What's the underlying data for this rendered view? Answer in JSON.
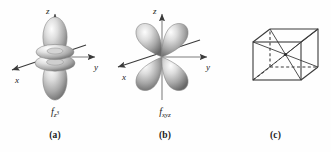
{
  "figure": {
    "background_color": "#ffffff",
    "line_color": "#3a3a3a",
    "text_color": "#1a1a1a",
    "lobe_light": "#f2f2f2",
    "lobe_mid": "#b9b9b9",
    "lobe_dark": "#6e6e6e"
  },
  "panels": [
    {
      "id": "a",
      "caption": "(a)",
      "orbital_symbol": "f",
      "orbital_sub": "z",
      "orbital_sup": "3",
      "orbital_name": "f_z3",
      "axes": [
        {
          "name": "z",
          "label": "z",
          "direction": "up"
        },
        {
          "name": "y",
          "label": "y",
          "direction": "right"
        },
        {
          "name": "x",
          "label": "x",
          "direction": "down-left"
        }
      ],
      "shape_description": "two axial lobes along z with two toroidal rings"
    },
    {
      "id": "b",
      "caption": "(b)",
      "orbital_symbol": "f",
      "orbital_sub": "xyz",
      "orbital_sup": "",
      "orbital_name": "f_xyz",
      "axes": [
        {
          "name": "z",
          "label": "z",
          "direction": "up"
        },
        {
          "name": "y",
          "label": "y",
          "direction": "right"
        },
        {
          "name": "x",
          "label": "x",
          "direction": "down-left"
        }
      ],
      "shape_description": "eight lobes pointing to cube corners, four visible"
    },
    {
      "id": "c",
      "caption": "(c)",
      "orbital_symbol": "",
      "orbital_sub": "",
      "orbital_sup": "",
      "orbital_name": "cube-diagram",
      "axes": [],
      "shape_description": "cube in perspective with eight diagonals from centre to corners"
    }
  ]
}
